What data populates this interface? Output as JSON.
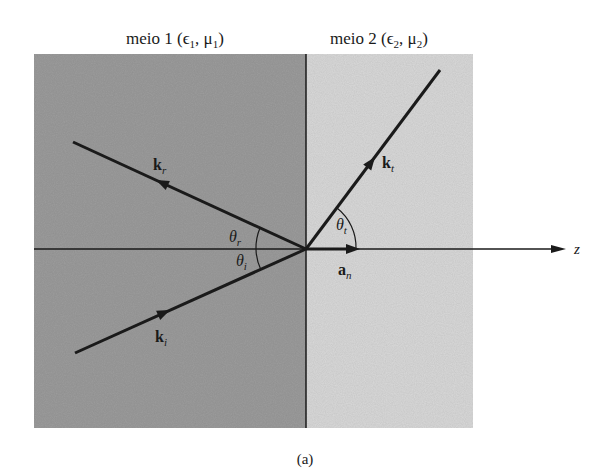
{
  "figure": {
    "caption": "(a)",
    "medium1": {
      "label": "meio 1 (ϵ",
      "sub1": "1",
      "mid": ", μ",
      "sub2": "1",
      "end": ")",
      "color": "#9c9c9c"
    },
    "medium2": {
      "label": "meio 2 (ϵ",
      "sub1": "2",
      "mid": ", μ",
      "sub2": "2",
      "end": ")",
      "color": "#d9d9d9"
    },
    "axis_label": "z",
    "vectors": {
      "incident": {
        "name": "k",
        "sub": "i"
      },
      "reflected": {
        "name": "k",
        "sub": "r"
      },
      "transmitted": {
        "name": "k",
        "sub": "t"
      },
      "normal": {
        "name": "a",
        "sub": "n"
      }
    },
    "angles": {
      "incident": {
        "symbol": "θ",
        "sub": "i"
      },
      "reflected": {
        "symbol": "θ",
        "sub": "r"
      },
      "transmitted": {
        "symbol": "θ",
        "sub": "t"
      }
    }
  }
}
